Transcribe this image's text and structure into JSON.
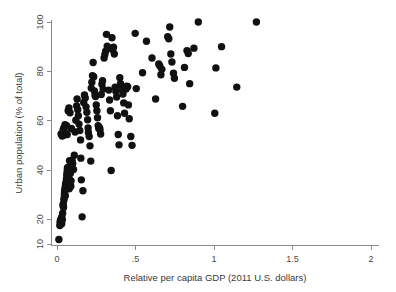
{
  "chart_data": {
    "type": "scatter",
    "title": "",
    "subtitle": "",
    "xlabel": "Relative per capita GDP (2011 U.S. dollars)",
    "ylabel": "Urban population (% of total)",
    "xlim": [
      0,
      2
    ],
    "ylim": [
      10,
      100
    ],
    "xticks": [
      0,
      0.5,
      1,
      1.5,
      2
    ],
    "xticklabels": [
      "0",
      ".5",
      "1",
      "1.5",
      "2"
    ],
    "yticks": [
      10,
      20,
      40,
      60,
      80,
      100
    ],
    "yticklabels": [
      "10",
      "20",
      "40",
      "60",
      "80",
      "100"
    ],
    "grid": false,
    "legend": null,
    "legend_position": "none",
    "marker": {
      "shape": "circle",
      "color": "#111111",
      "size_px": 4.6
    },
    "series": [
      {
        "name": "Countries",
        "points": [
          [
            0.012,
            11.8
          ],
          [
            0.018,
            17.5
          ],
          [
            0.02,
            18.8
          ],
          [
            0.022,
            19.6
          ],
          [
            0.024,
            19.2
          ],
          [
            0.027,
            20.4
          ],
          [
            0.03,
            18.2
          ],
          [
            0.031,
            21.0
          ],
          [
            0.034,
            19.8
          ],
          [
            0.036,
            22.5
          ],
          [
            0.038,
            25.6
          ],
          [
            0.04,
            26.2
          ],
          [
            0.042,
            24.8
          ],
          [
            0.044,
            27.8
          ],
          [
            0.045,
            28.6
          ],
          [
            0.047,
            30.2
          ],
          [
            0.049,
            31.4
          ],
          [
            0.05,
            32.0
          ],
          [
            0.052,
            33.0
          ],
          [
            0.053,
            29.6
          ],
          [
            0.055,
            34.2
          ],
          [
            0.057,
            35.0
          ],
          [
            0.058,
            32.6
          ],
          [
            0.06,
            36.4
          ],
          [
            0.062,
            38.0
          ],
          [
            0.064,
            39.2
          ],
          [
            0.066,
            40.6
          ],
          [
            0.068,
            41.0
          ],
          [
            0.07,
            37.2
          ],
          [
            0.072,
            34.8
          ],
          [
            0.075,
            33.6
          ],
          [
            0.078,
            32.4
          ],
          [
            0.08,
            43.8
          ],
          [
            0.082,
            36.0
          ],
          [
            0.085,
            38.6
          ],
          [
            0.088,
            33.4
          ],
          [
            0.09,
            35.6
          ],
          [
            0.026,
            54.6
          ],
          [
            0.033,
            53.8
          ],
          [
            0.039,
            56.2
          ],
          [
            0.043,
            57.0
          ],
          [
            0.046,
            54.2
          ],
          [
            0.051,
            58.4
          ],
          [
            0.056,
            55.0
          ],
          [
            0.061,
            58.0
          ],
          [
            0.065,
            54.4
          ],
          [
            0.071,
            64.0
          ],
          [
            0.076,
            65.2
          ],
          [
            0.083,
            63.2
          ],
          [
            0.092,
            56.8
          ],
          [
            0.096,
            44.0
          ],
          [
            0.1,
            42.6
          ],
          [
            0.105,
            40.2
          ],
          [
            0.11,
            46.0
          ],
          [
            0.115,
            55.4
          ],
          [
            0.12,
            60.2
          ],
          [
            0.125,
            66.0
          ],
          [
            0.128,
            68.8
          ],
          [
            0.132,
            64.4
          ],
          [
            0.136,
            62.0
          ],
          [
            0.14,
            58.6
          ],
          [
            0.145,
            56.0
          ],
          [
            0.15,
            52.2
          ],
          [
            0.152,
            44.8
          ],
          [
            0.155,
            36.0
          ],
          [
            0.16,
            21.0
          ],
          [
            0.165,
            31.6
          ],
          [
            0.17,
            67.4
          ],
          [
            0.175,
            70.4
          ],
          [
            0.18,
            69.2
          ],
          [
            0.185,
            65.6
          ],
          [
            0.19,
            63.4
          ],
          [
            0.195,
            60.4
          ],
          [
            0.198,
            57.0
          ],
          [
            0.2,
            55.2
          ],
          [
            0.205,
            53.6
          ],
          [
            0.21,
            49.8
          ],
          [
            0.215,
            43.6
          ],
          [
            0.218,
            73.2
          ],
          [
            0.222,
            75.6
          ],
          [
            0.226,
            78.2
          ],
          [
            0.23,
            83.6
          ],
          [
            0.234,
            77.8
          ],
          [
            0.238,
            72.0
          ],
          [
            0.242,
            70.2
          ],
          [
            0.246,
            69.8
          ],
          [
            0.25,
            66.4
          ],
          [
            0.254,
            64.0
          ],
          [
            0.258,
            61.2
          ],
          [
            0.262,
            58.0
          ],
          [
            0.266,
            56.8
          ],
          [
            0.27,
            57.2
          ],
          [
            0.274,
            56.4
          ],
          [
            0.278,
            54.6
          ],
          [
            0.282,
            70.6
          ],
          [
            0.286,
            74.8
          ],
          [
            0.29,
            76.2
          ],
          [
            0.294,
            72.8
          ],
          [
            0.3,
            85.4
          ],
          [
            0.305,
            86.8
          ],
          [
            0.31,
            88.2
          ],
          [
            0.315,
            95.0
          ],
          [
            0.32,
            90.2
          ],
          [
            0.325,
            89.4
          ],
          [
            0.33,
            72.4
          ],
          [
            0.335,
            68.4
          ],
          [
            0.34,
            64.0
          ],
          [
            0.345,
            39.8
          ],
          [
            0.35,
            93.6
          ],
          [
            0.355,
            88.8
          ],
          [
            0.36,
            89.8
          ],
          [
            0.365,
            87.0
          ],
          [
            0.37,
            73.6
          ],
          [
            0.375,
            71.8
          ],
          [
            0.38,
            69.6
          ],
          [
            0.385,
            62.0
          ],
          [
            0.39,
            54.4
          ],
          [
            0.395,
            50.2
          ],
          [
            0.4,
            77.4
          ],
          [
            0.405,
            75.0
          ],
          [
            0.41,
            74.2
          ],
          [
            0.415,
            72.6
          ],
          [
            0.42,
            70.8
          ],
          [
            0.425,
            67.2
          ],
          [
            0.43,
            63.0
          ],
          [
            0.44,
            72.8
          ],
          [
            0.445,
            74.0
          ],
          [
            0.45,
            73.8
          ],
          [
            0.455,
            66.4
          ],
          [
            0.46,
            60.8
          ],
          [
            0.47,
            53.6
          ],
          [
            0.478,
            50.0
          ],
          [
            0.498,
            95.4
          ],
          [
            0.505,
            73.0
          ],
          [
            0.545,
            79.4
          ],
          [
            0.57,
            92.2
          ],
          [
            0.605,
            85.4
          ],
          [
            0.628,
            68.8
          ],
          [
            0.648,
            83.0
          ],
          [
            0.655,
            82.2
          ],
          [
            0.662,
            78.6
          ],
          [
            0.668,
            80.8
          ],
          [
            0.705,
            94.0
          ],
          [
            0.712,
            93.2
          ],
          [
            0.718,
            98.0
          ],
          [
            0.725,
            87.0
          ],
          [
            0.732,
            83.8
          ],
          [
            0.742,
            79.2
          ],
          [
            0.748,
            77.2
          ],
          [
            0.8,
            65.8
          ],
          [
            0.812,
            81.6
          ],
          [
            0.828,
            88.4
          ],
          [
            0.836,
            87.2
          ],
          [
            0.845,
            75.0
          ],
          [
            0.872,
            89.4
          ],
          [
            0.9,
            100.0
          ],
          [
            1.005,
            63.0
          ],
          [
            1.012,
            81.4
          ],
          [
            1.048,
            90.0
          ],
          [
            1.145,
            73.6
          ],
          [
            1.27,
            100.0
          ]
        ]
      }
    ]
  },
  "axes": {
    "x_title": "Relative per capita GDP (2011 U.S. dollars)",
    "y_title": "Urban population (% of total)",
    "x_tick_labels": [
      "0",
      ".5",
      "1",
      "1.5",
      "2"
    ],
    "y_tick_labels": [
      "10",
      "20",
      "40",
      "60",
      "80",
      "100"
    ]
  }
}
